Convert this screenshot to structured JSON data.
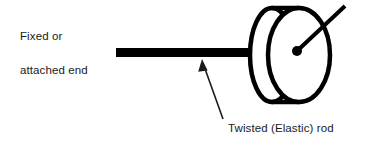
{
  "figure": {
    "background_color": "#ffffff",
    "stroke_color": "#000000",
    "text_color": "#1a1a1a",
    "labels": {
      "fixed_end_line1": "Fixed or",
      "fixed_end_line2": "attached end",
      "twisted_rod": "Twisted (Elastic) rod"
    },
    "parts": {
      "rod": {
        "name": "rod-bar",
        "x": 116,
        "y": 48,
        "width": 137,
        "height": 9,
        "color": "#000000"
      },
      "disc_front": {
        "name": "disc-front-ellipse",
        "cx": 299,
        "cy": 55,
        "rx": 31,
        "ry": 47,
        "stroke_width": 4.5
      },
      "disc_back": {
        "name": "disc-back-ellipse",
        "cx": 272,
        "cy": 55,
        "rx": 22,
        "ry": 47,
        "stroke_width": 4.5
      },
      "hub": {
        "name": "disc-center-hub",
        "cx": 297,
        "cy": 51,
        "r": 5,
        "color": "#000000"
      },
      "needle": {
        "name": "radial-needle",
        "x1": 297,
        "y1": 51,
        "x2": 345,
        "y2": 6,
        "stroke_width": 4
      },
      "pointer_arrow": {
        "name": "rod-pointer-arrow",
        "x1": 223,
        "y1": 119,
        "x2": 202,
        "y2": 61,
        "stroke_width": 1.6,
        "head_length": 11,
        "head_width": 7
      }
    }
  }
}
